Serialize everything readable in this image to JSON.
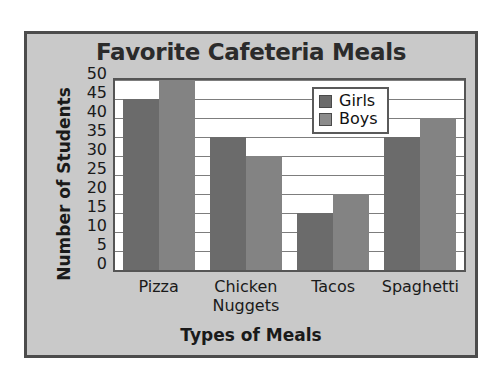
{
  "chart_data": {
    "type": "bar",
    "title": "Favorite Cafeteria Meals",
    "xlabel": "Types of Meals",
    "ylabel": "Number of Students",
    "categories": [
      "Pizza",
      "Chicken Nuggets",
      "Tacos",
      "Spaghetti"
    ],
    "category_lines": [
      [
        "Pizza"
      ],
      [
        "Chicken",
        "Nuggets"
      ],
      [
        "Tacos"
      ],
      [
        "Spaghetti"
      ]
    ],
    "series": [
      {
        "name": "Girls",
        "values": [
          45,
          35,
          15,
          35
        ],
        "color": "#6b6b6b"
      },
      {
        "name": "Boys",
        "values": [
          50,
          30,
          20,
          40
        ],
        "color": "#838383"
      }
    ],
    "ylim": [
      0,
      50
    ],
    "ytick_step": 5,
    "yticks": [
      50,
      45,
      40,
      35,
      30,
      25,
      20,
      15,
      10,
      5,
      0
    ],
    "grid": true,
    "legend_position": "top-right",
    "panel_color": "#c9c9c9",
    "plot_background": "#ffffff",
    "border_color": "#4c4c4c"
  },
  "legend": {
    "entries": [
      {
        "label": "Girls",
        "swatch": "#6b6b6b"
      },
      {
        "label": "Boys",
        "swatch": "#8b8b8b"
      }
    ]
  }
}
